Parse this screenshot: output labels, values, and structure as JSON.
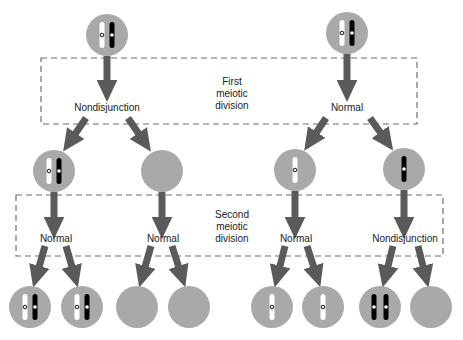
{
  "colors": {
    "cell": "#a9a9a9",
    "arrow": "#5a5a5a",
    "box_border": "#6e6e6e",
    "chromosome_light": "#ffffff",
    "chromosome_dark": "#000000",
    "text": "#1a1a1a"
  },
  "boxes": [
    {
      "id": "first-division-box",
      "label_lines": [
        "First",
        "meiotic",
        "division"
      ]
    },
    {
      "id": "second-division-box",
      "label_lines": [
        "Second",
        "meiotic",
        "division"
      ]
    }
  ],
  "first_division": {
    "left_outcome": "Nondisjunction",
    "right_outcome": "Normal"
  },
  "second_division": {
    "outcomes": [
      "Normal",
      "Normal",
      "Normal",
      "Nondisjunction"
    ]
  },
  "cells": {
    "top": [
      {
        "x": 107,
        "y": 35,
        "chromosomes": "light+dark"
      },
      {
        "x": 347,
        "y": 33,
        "chromosomes": "light+dark"
      }
    ],
    "middle": [
      {
        "x": 54,
        "y": 171,
        "chromosomes": "light+dark"
      },
      {
        "x": 162,
        "y": 171,
        "chromosomes": "none"
      },
      {
        "x": 295,
        "y": 170,
        "chromosomes": "light"
      },
      {
        "x": 404,
        "y": 169,
        "chromosomes": "dark"
      }
    ],
    "bottom": [
      {
        "x": 30,
        "y": 307,
        "chromosomes": "light+dark"
      },
      {
        "x": 82,
        "y": 307,
        "chromosomes": "light+dark"
      },
      {
        "x": 137,
        "y": 307,
        "chromosomes": "none"
      },
      {
        "x": 189,
        "y": 307,
        "chromosomes": "none"
      },
      {
        "x": 272,
        "y": 307,
        "chromosomes": "light"
      },
      {
        "x": 323,
        "y": 307,
        "chromosomes": "light"
      },
      {
        "x": 380,
        "y": 307,
        "chromosomes": "dark+dark"
      },
      {
        "x": 431,
        "y": 307,
        "chromosomes": "none"
      }
    ]
  }
}
